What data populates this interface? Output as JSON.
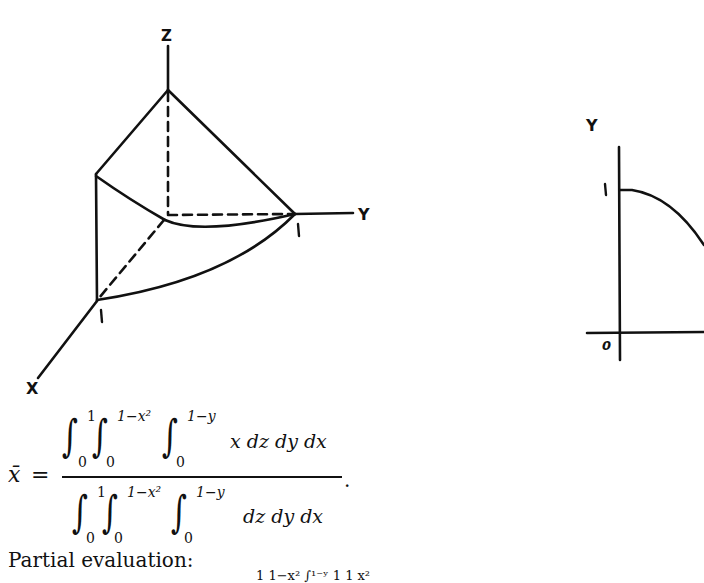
{
  "figure_3d": {
    "axis_labels": {
      "z": "Z",
      "y": "Y",
      "x": "X"
    },
    "tick_labels": {
      "y_one": "1",
      "x_one": "1"
    }
  },
  "figure_2d": {
    "axis_labels": {
      "y": "Y"
    },
    "tick_labels": {
      "y_one": "1",
      "origin": "0"
    }
  },
  "equation": {
    "lhs": "x̄",
    "equals": "=",
    "numerator": {
      "integral_1": {
        "lower": "0",
        "upper": "1"
      },
      "integral_2": {
        "lower": "0",
        "upper": "1−x²"
      },
      "integral_3": {
        "lower": "0",
        "upper": "1−y"
      },
      "integrand": "x dz dy dx"
    },
    "denominator": {
      "integral_1": {
        "lower": "0",
        "upper": "1"
      },
      "integral_2": {
        "lower": "0",
        "upper": "1−x²"
      },
      "integral_3": {
        "lower": "0",
        "upper": "1−y"
      },
      "integrand": "dz dy dx"
    },
    "period": "."
  },
  "text": {
    "partial_evaluation": "Partial evaluation:",
    "cut_off_line": "1   1−x²     ∫¹⁻ʸ                     1   1   x²"
  }
}
